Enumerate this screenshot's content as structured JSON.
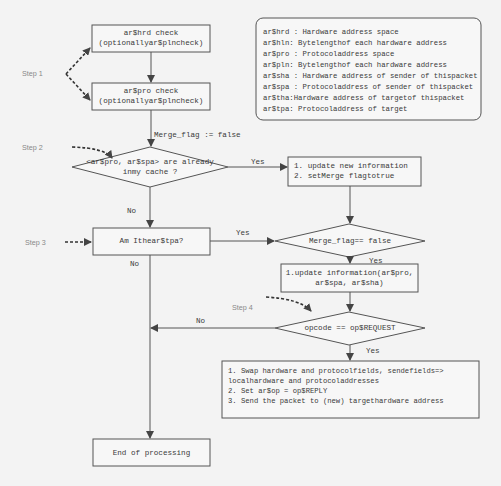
{
  "diagram": {
    "type": "flowchart",
    "steps": [
      "Step 1",
      "Step 2",
      "Step 3",
      "Step 4"
    ],
    "nodes": {
      "hrd_check": {
        "line1": "ar$hrd check",
        "line2": "(optionallyar$plncheck)"
      },
      "pro_check": {
        "line1": "ar$pro check",
        "line2": "(optionallyar$plncheck)"
      },
      "merge_init": "Merge_flag := false",
      "cache_decision": {
        "line1": "<ar$pro, ar$spa> are already",
        "line2": "inmy cache ?"
      },
      "update_new": {
        "line1": "1. update new information",
        "line2": "2. setMerge flagtotrue"
      },
      "merge_decision": "Merge_flag== false",
      "tpa_check": "Am Ithear$tpa?",
      "update_info": {
        "line1": "1.update information(ar$pro,",
        "line2": "ar$spa, ar$sha)"
      },
      "opcode_decision": "opcode == op$REQUEST",
      "reply_actions": [
        "1. Swap hardware and protocolfields, sendefields=>",
        "localhardware and protocoladdresses",
        "2. Set ar$op = op$REPLY",
        "3. Send the packet to (new) targethardware address"
      ],
      "end": "End of processing"
    },
    "edge_labels": {
      "cache_yes": "Yes",
      "cache_no": "No",
      "tpa_yes": "Yes",
      "tpa_no": "No",
      "merge_yes": "Yes",
      "opcode_no": "No",
      "opcode_yes": "Yes"
    },
    "legend": [
      "ar$hrd : Hardware address space",
      "ar$hln: Bytelengthof each hardware address",
      "ar$pro : Protocoladdress space",
      "ar$pln: Bytelengthof each hardware address",
      "ar$sha : Hardware address of sender of thispacket",
      "ar$spa : Protocoladdress of sender of thispacket",
      "ar$tha:Hardware address of targetof thispacket",
      "ar$tpa: Protocoladdress of target"
    ]
  },
  "colors": {
    "line": "#444444",
    "background": "#f3f3f3",
    "step_text": "#888888"
  }
}
